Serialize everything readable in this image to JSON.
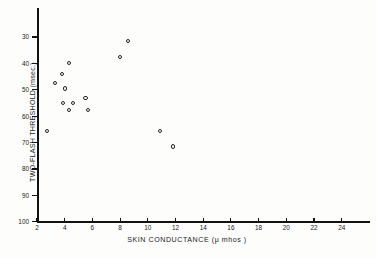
{
  "chart_data": {
    "type": "scatter",
    "title": "",
    "xlabel": "SKIN  CONDUCTANCE  (μ mhos )",
    "ylabel": "TWO-FLASH THRESHOLD (msec.)",
    "xlim": [
      2,
      25.5
    ],
    "ylim": [
      100,
      25
    ],
    "y_inverted": true,
    "grid": false,
    "legend": null,
    "xticks": [
      2,
      4,
      6,
      8,
      10,
      12,
      14,
      16,
      18,
      20,
      22,
      24
    ],
    "xticklabels": [
      "2",
      "4",
      "6",
      "8",
      "10",
      "12",
      "14",
      "16",
      "18",
      "20",
      "22",
      "24"
    ],
    "yticks": [
      30,
      40,
      50,
      60,
      70,
      80,
      90,
      100
    ],
    "yticklabels": [
      "30",
      "40",
      "50",
      "60",
      "70",
      "80",
      "90",
      "100"
    ],
    "marker": "open-circle",
    "marker_color": "#262626",
    "points": [
      {
        "x": 2.7,
        "y": 65.5
      },
      {
        "x": 3.3,
        "y": 47.5
      },
      {
        "x": 3.8,
        "y": 44.0
      },
      {
        "x": 3.85,
        "y": 55.0
      },
      {
        "x": 4.0,
        "y": 49.5
      },
      {
        "x": 4.3,
        "y": 40.0
      },
      {
        "x": 4.3,
        "y": 57.5
      },
      {
        "x": 4.6,
        "y": 55.0
      },
      {
        "x": 5.5,
        "y": 53.0
      },
      {
        "x": 5.7,
        "y": 57.5
      },
      {
        "x": 8.0,
        "y": 37.5
      },
      {
        "x": 8.6,
        "y": 31.5
      },
      {
        "x": 10.9,
        "y": 65.5
      },
      {
        "x": 11.8,
        "y": 71.5
      }
    ]
  }
}
